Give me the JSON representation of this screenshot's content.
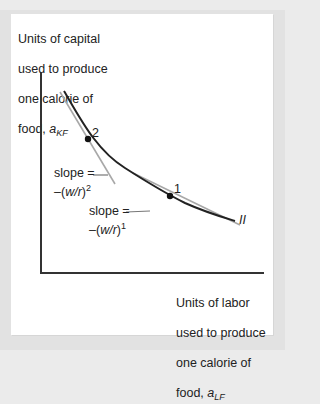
{
  "diagram": {
    "y_axis_label": {
      "line1": "Units of capital",
      "line2": "used to produce",
      "line3": "one calorie of",
      "line4_prefix": "food, ",
      "var": "a",
      "subscript": "KF"
    },
    "x_axis_label": {
      "line1": "Units of labor",
      "line2": "used to produce",
      "line3": "one calorie of",
      "line4_prefix": "food, ",
      "var": "a",
      "subscript": "LF"
    },
    "curve_label": "II",
    "points": [
      {
        "id": "2",
        "label": "2"
      },
      {
        "id": "1",
        "label": "1"
      }
    ],
    "slopes": [
      {
        "point": "2",
        "line1": "slope =",
        "line2_prefix": "–(",
        "ratio": "w/r",
        "line2_suffix": ")",
        "exponent": "2"
      },
      {
        "point": "1",
        "line1": "slope =",
        "line2_prefix": "–(",
        "ratio": "w/r",
        "line2_suffix": ")",
        "exponent": "1"
      }
    ],
    "colors": {
      "curve": "#222222",
      "tangent": "#a8a8a8",
      "axis": "#333333",
      "frame": "#e2e2e2",
      "panel": "#ffffff"
    }
  }
}
